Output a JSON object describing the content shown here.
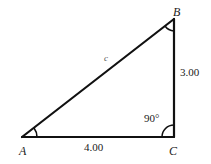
{
  "diagram": {
    "type": "right-triangle",
    "vertices": {
      "A": {
        "label": "A",
        "x": 22,
        "y": 137
      },
      "B": {
        "label": "B",
        "x": 174,
        "y": 19
      },
      "C": {
        "label": "C",
        "x": 174,
        "y": 137
      }
    },
    "sides": {
      "hypotenuse": {
        "label": "c",
        "from": "A",
        "to": "B"
      },
      "vertical": {
        "label": "3.00",
        "from": "B",
        "to": "C"
      },
      "base": {
        "label": "4.00",
        "from": "A",
        "to": "C"
      }
    },
    "angles": {
      "C": {
        "label": "90°",
        "right_angle": true
      }
    },
    "colors": {
      "stroke": "#111111",
      "background": "#ffffff"
    }
  }
}
